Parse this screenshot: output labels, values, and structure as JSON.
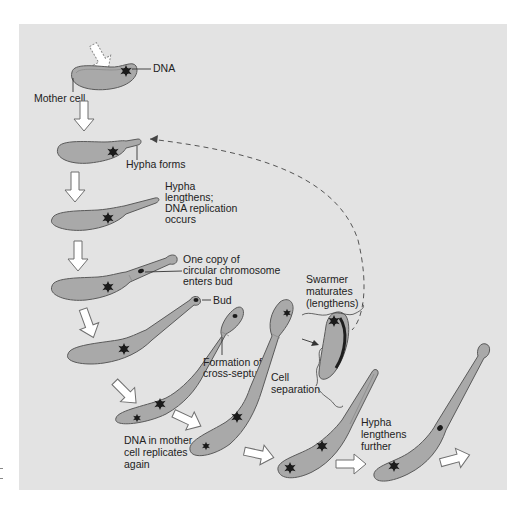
{
  "figure": {
    "labels": {
      "dna": "DNA",
      "mother_cell": "Mother cell",
      "hypha_forms": "Hypha forms",
      "hypha_lengthens_1": "Hypha",
      "hypha_lengthens_2": "lengthens;",
      "hypha_lengthens_3": "DNA replication",
      "hypha_lengthens_4": "occurs",
      "one_copy_1": "One copy of",
      "one_copy_2": "circular chromosome",
      "one_copy_3": "enters bud",
      "bud": "Bud",
      "cross_septum_1": "Formation of",
      "cross_septum_2": "cross-septum",
      "swarmer_1": "Swarmer",
      "swarmer_2": "maturates",
      "swarmer_3": "(lengthens)",
      "cell_sep_1": "Cell",
      "cell_sep_2": "separation",
      "dna_mother_1": "DNA in mother",
      "dna_mother_2": "cell replicates",
      "dna_mother_3": "again",
      "hypha_further_1": "Hypha",
      "hypha_further_2": "lengthens",
      "hypha_further_3": "further"
    },
    "colors": {
      "panel_background": "#e3e3e3",
      "cell_fill": "#a9a9a9",
      "cell_outline": "#5a5a5a",
      "dna": "#1b1b1b",
      "arrow_fill": "#ffffff"
    }
  }
}
